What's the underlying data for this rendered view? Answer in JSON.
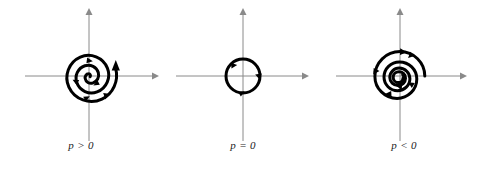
{
  "figure": {
    "background_color": "#ffffff",
    "axis_color": "#8a8a8a",
    "curve_color": "#000000",
    "width": 485,
    "height": 169
  },
  "panels": [
    {
      "id": "panel-unstable-spiral",
      "label": "p > 0",
      "trajectory_type": "unstable-spiral",
      "direction": "counterclockwise-outward",
      "center": [
        89,
        76
      ],
      "axis": {
        "x_range": [
          25,
          155
        ],
        "y_range": [
          11,
          141
        ],
        "x_axis_y": 76,
        "y_axis_x": 89
      },
      "arrow_count": 4
    },
    {
      "id": "panel-center",
      "label": "p = 0",
      "trajectory_type": "center",
      "direction": "counterclockwise-closed-orbit",
      "center": [
        243,
        76
      ],
      "radius": 17,
      "axis": {
        "x_range": [
          176,
          306
        ],
        "y_range": [
          11,
          141
        ],
        "x_axis_y": 76,
        "y_axis_x": 243
      },
      "arrow_count": 3
    },
    {
      "id": "panel-stable-spiral",
      "label": "p < 0",
      "trajectory_type": "stable-spiral",
      "direction": "clockwise-inward",
      "center": [
        400,
        76
      ],
      "axis": {
        "x_range": [
          336,
          466
        ],
        "y_range": [
          11,
          141
        ],
        "x_axis_y": 76,
        "y_axis_x": 400
      },
      "arrow_count": 5
    }
  ]
}
